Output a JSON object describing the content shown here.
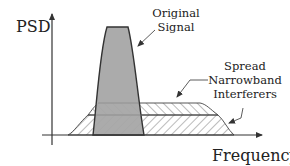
{
  "diagram": {
    "type": "spectrum-sketch",
    "y_axis_label": "PSD",
    "x_axis_label": "Frequency",
    "annotations": {
      "signal": {
        "line1": "Original",
        "line2": "Signal"
      },
      "interferers": {
        "line1": "Spread",
        "line2": "Narrowband",
        "line3": "Interferers"
      }
    },
    "colors": {
      "signal_fill": "#a6a6a6",
      "outline": "#333333",
      "hatch": "#555555",
      "text": "#222222"
    }
  }
}
